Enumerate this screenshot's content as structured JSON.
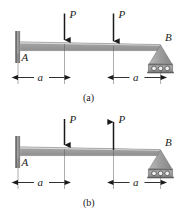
{
  "figure": {
    "type": "beam-loading-diagram",
    "background": "#ffffff",
    "ink_color": "#1a1a1a",
    "beam_color": "#9a9a9a",
    "beam_highlight": "#d4d4d4",
    "support_color": "#a8a8a8",
    "panels": [
      {
        "id": "a",
        "caption": "(a)",
        "beam": {
          "left_label": "A",
          "right_label": "B",
          "length_note": "2a"
        },
        "supports": [
          {
            "name": "fixed-wall-support",
            "at": "A",
            "kind": "wall"
          },
          {
            "name": "roller-support",
            "at": "B",
            "kind": "pin-roller"
          }
        ],
        "loads": [
          {
            "name": "load-p1",
            "label": "P",
            "direction": "down",
            "position": "a"
          },
          {
            "name": "load-p2",
            "label": "P",
            "direction": "down",
            "position": "2a-from-left-minus-a"
          }
        ],
        "dimensions": [
          {
            "name": "dimension-a-left",
            "label": "a"
          },
          {
            "name": "dimension-a-right",
            "label": "a"
          }
        ]
      },
      {
        "id": "b",
        "caption": "(b)",
        "beam": {
          "left_label": "A",
          "right_label": "B",
          "length_note": "2a"
        },
        "supports": [
          {
            "name": "fixed-wall-support",
            "at": "A",
            "kind": "wall"
          },
          {
            "name": "roller-support",
            "at": "B",
            "kind": "pin-roller"
          }
        ],
        "loads": [
          {
            "name": "load-p1",
            "label": "P",
            "direction": "down",
            "position": "a"
          },
          {
            "name": "load-p2",
            "label": "P",
            "direction": "up",
            "position": "2a-from-left-minus-a"
          }
        ],
        "dimensions": [
          {
            "name": "dimension-a-left",
            "label": "a"
          },
          {
            "name": "dimension-a-right",
            "label": "a"
          }
        ]
      }
    ]
  },
  "labels": {
    "a_panel": {
      "A": "A",
      "B": "B",
      "P1": "P",
      "P2": "P",
      "dim_left": "a",
      "dim_right": "a",
      "caption": "(a)"
    },
    "b_panel": {
      "A": "A",
      "B": "B",
      "P1": "P",
      "P2": "P",
      "dim_left": "a",
      "dim_right": "a",
      "caption": "(b)"
    }
  }
}
